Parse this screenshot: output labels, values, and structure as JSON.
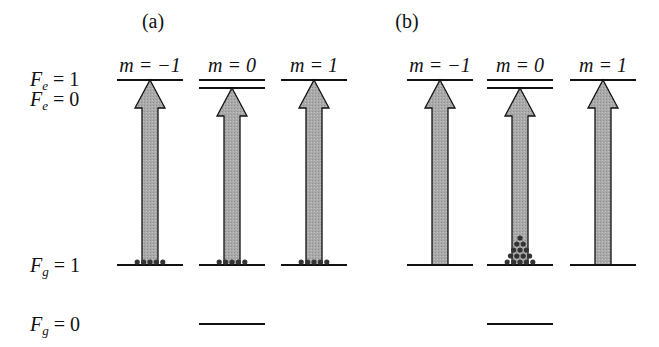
{
  "panels": [
    {
      "label": "(a)",
      "m_labels": [
        "m = −1",
        "m = 0",
        "m = 1"
      ],
      "ground_populations": [
        5,
        5,
        5
      ],
      "population_shape": "uniform"
    },
    {
      "label": "(b)",
      "m_labels": [
        "m = −1",
        "m = 0",
        "m = 1"
      ],
      "ground_populations": [
        0,
        15,
        0
      ],
      "population_shape": "pyramid"
    }
  ],
  "levels": {
    "Fe1": {
      "sym": "F",
      "sub": "e",
      "eq": " = 1"
    },
    "Fe0": {
      "sym": "F",
      "sub": "e",
      "eq": " = 0"
    },
    "Fg1": {
      "sym": "F",
      "sub": "g",
      "eq": " = 1"
    },
    "Fg0": {
      "sym": "F",
      "sub": "g",
      "eq": " = 0"
    }
  },
  "colors": {
    "arrow_fill": "#a9a9a9",
    "line": "#111111",
    "dot": "#333333"
  }
}
